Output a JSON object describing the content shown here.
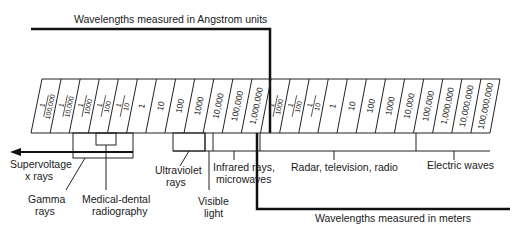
{
  "title_top": "Wavelengths measured in Angstrom units",
  "title_bottom": "Wavelengths measured in meters",
  "scale_cells": [
    {
      "num": "1",
      "den": "100,000",
      "type": "frac"
    },
    {
      "num": "1",
      "den": "10,000",
      "type": "frac"
    },
    {
      "num": "1",
      "den": "1000",
      "type": "frac"
    },
    {
      "num": "1",
      "den": "100",
      "type": "frac"
    },
    {
      "num": "1",
      "den": "10",
      "type": "frac"
    },
    {
      "value": "1",
      "type": "int"
    },
    {
      "value": "10",
      "type": "int"
    },
    {
      "value": "100",
      "type": "int"
    },
    {
      "value": "1000",
      "type": "int"
    },
    {
      "value": "10,000",
      "type": "int"
    },
    {
      "value": "100,000",
      "type": "int"
    },
    {
      "value": "1,000,000",
      "type": "int"
    },
    {
      "num": "1",
      "den": "1000",
      "type": "frac"
    },
    {
      "num": "1",
      "den": "100",
      "type": "frac"
    },
    {
      "num": "1",
      "den": "10",
      "type": "frac"
    },
    {
      "value": "1",
      "type": "int"
    },
    {
      "value": "10",
      "type": "int"
    },
    {
      "value": "100",
      "type": "int"
    },
    {
      "value": "1000",
      "type": "int"
    },
    {
      "value": "10,000",
      "type": "int"
    },
    {
      "value": "100,000",
      "type": "int"
    },
    {
      "value": "1,000,000",
      "type": "int"
    },
    {
      "value": "10,000,000",
      "type": "int"
    },
    {
      "value": "100,000,000",
      "type": "int"
    }
  ],
  "regions": {
    "supervoltage": "Supervoltage",
    "supervoltage2": "x rays",
    "gamma": "Gamma",
    "gamma2": "rays",
    "medical": "Medical-dental",
    "medical2": "radiography",
    "ultraviolet": "Ultraviolet",
    "ultraviolet2": "rays",
    "visible": "Visible",
    "visible2": "light",
    "infrared": "Infrared rays,",
    "infrared2": "microwaves",
    "radar": "Radar, television, radio",
    "electric": "Electric waves"
  },
  "colors": {
    "line": "#111111",
    "text": "#1a1a1a",
    "background": "#ffffff"
  }
}
